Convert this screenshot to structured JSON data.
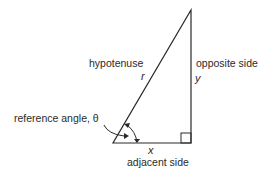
{
  "diagram": {
    "type": "right-triangle",
    "labels": {
      "hypotenuse": "hypotenuse",
      "hypotenuse_var": "r",
      "opposite": "opposite side",
      "opposite_var": "y",
      "adjacent": "adjacent side",
      "adjacent_var": "x",
      "angle": "reference angle, θ"
    },
    "colors": {
      "stroke": "#2a2a2a",
      "background": "#ffffff"
    }
  }
}
